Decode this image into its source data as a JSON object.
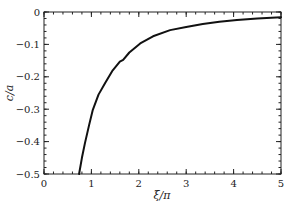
{
  "chart_data": {
    "type": "line",
    "title": "",
    "xlabel": "ξ/π",
    "ylabel": "c/a",
    "xlim": [
      0,
      5
    ],
    "ylim": [
      -0.5,
      0
    ],
    "xticks": [
      0,
      1,
      2,
      3,
      4,
      5
    ],
    "xtick_labels": [
      "0",
      "1",
      "2",
      "3",
      "4",
      "5"
    ],
    "yticks": [
      0,
      -0.1,
      -0.2,
      -0.3,
      -0.4,
      -0.5
    ],
    "ytick_labels": [
      "0",
      "−0.1",
      "−0.2",
      "−0.3",
      "−0.4",
      "−0.5"
    ],
    "x_minor_step": 0.2,
    "y_minor_step": 0.02,
    "grid": false,
    "legend": null,
    "series": [
      {
        "name": "c/a",
        "color": "#111111",
        "x": [
          0.74,
          0.8,
          0.865,
          0.95,
          1.03,
          1.15,
          1.29,
          1.45,
          1.6,
          1.67,
          1.8,
          2.03,
          2.3,
          2.66,
          3.0,
          3.35,
          3.7,
          4.07,
          4.5,
          5.0
        ],
        "y": [
          -0.5,
          -0.45,
          -0.404,
          -0.35,
          -0.302,
          -0.255,
          -0.219,
          -0.18,
          -0.153,
          -0.148,
          -0.125,
          -0.097,
          -0.075,
          -0.056,
          -0.046,
          -0.037,
          -0.03,
          -0.025,
          -0.02,
          -0.016
        ]
      }
    ]
  }
}
